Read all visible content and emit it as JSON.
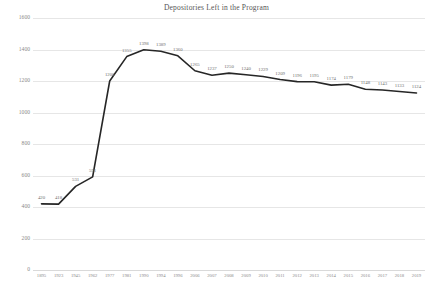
{
  "chart_data": {
    "type": "line",
    "title": "Depositories Left in the Program",
    "xlabel": "",
    "ylabel": "",
    "categories": [
      "1895",
      "1923",
      "1945",
      "1962",
      "1977",
      "1981",
      "1990",
      "1994",
      "1996",
      "2006",
      "2007",
      "2008",
      "2009",
      "2010",
      "2011",
      "2012",
      "2013",
      "2014",
      "2015",
      "2016",
      "2017",
      "2018",
      "2019"
    ],
    "values": [
      420,
      418,
      531,
      591,
      1200,
      1355,
      1398,
      1389,
      1360,
      1265,
      1237,
      1250,
      1240,
      1229,
      1209,
      1196,
      1195,
      1174,
      1179,
      1148,
      1143,
      1133,
      1124
    ],
    "point_labels": [
      "420",
      "418",
      "531",
      "591",
      "1200",
      "1355",
      "1398",
      "1389",
      "1360",
      "1265",
      "1237",
      "1250",
      "1240",
      "1229",
      "1209",
      "1196",
      "1195",
      "1174",
      "1179",
      "1148",
      "1143",
      "1133",
      "1124"
    ],
    "yticks": [
      0,
      200,
      400,
      600,
      800,
      1000,
      1200,
      1400,
      1600
    ],
    "ytick_labels": [
      "0",
      "200",
      "400",
      "600",
      "800",
      "1000",
      "1200",
      "1400",
      "1600"
    ],
    "ylim": [
      0,
      1600
    ],
    "grid": true,
    "legend": false,
    "line_color": "#262626",
    "grid_color": "#e6e6e6",
    "text_color": "#8a8a8a"
  }
}
